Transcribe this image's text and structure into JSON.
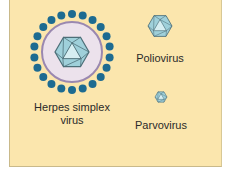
{
  "diagram": {
    "viruses": [
      {
        "id": "herpes",
        "label_line1": "Herpes simplex",
        "label_line2": "virus",
        "enveloped": true,
        "spike_count": 22
      },
      {
        "id": "polio",
        "label": "Poliovirus",
        "enveloped": false
      },
      {
        "id": "parvo",
        "label": "Parvovirus",
        "enveloped": false
      }
    ],
    "colors": {
      "background": "#fbe6ad",
      "spike": "#1d6b91",
      "envelope_fill": "#ece2ec",
      "envelope_stroke": "#9a88b0",
      "capsid_light": "#d6eef2",
      "capsid_mid": "#9fd0da",
      "capsid_dark": "#6aa8b6",
      "capsid_edge": "#4d6f78"
    }
  }
}
